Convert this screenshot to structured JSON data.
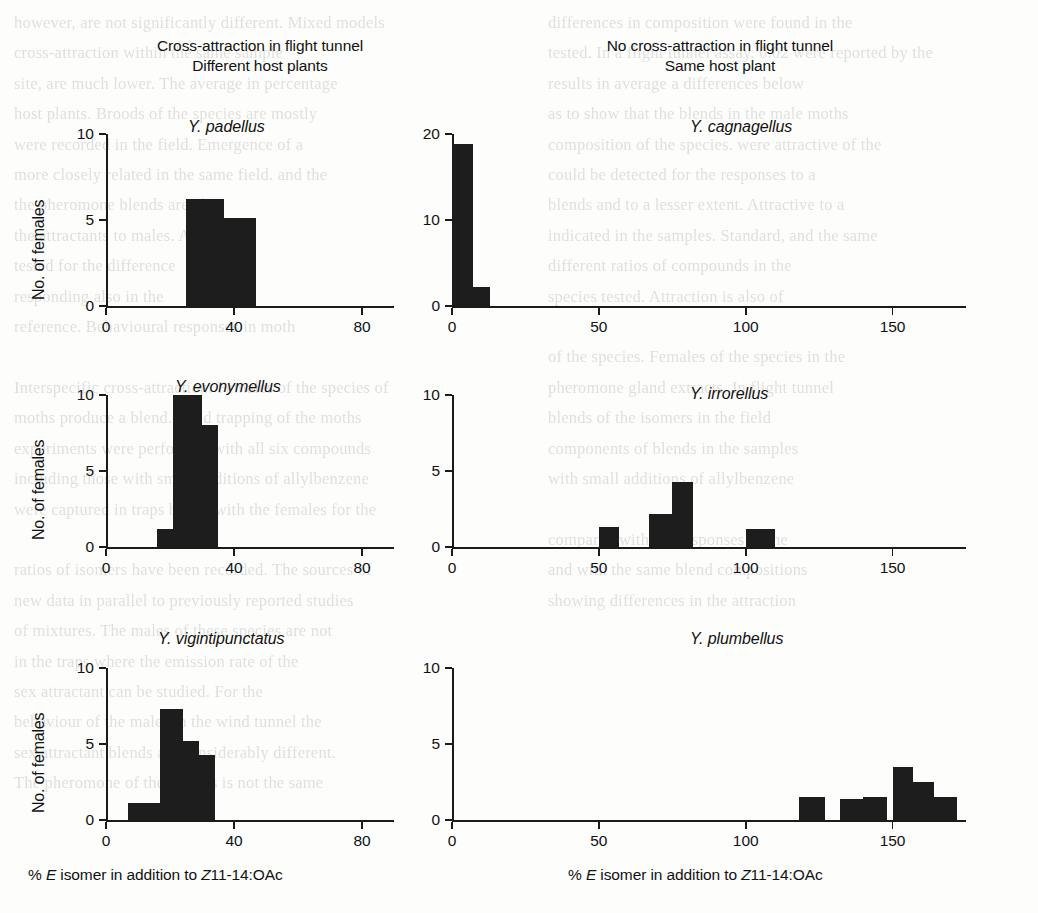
{
  "figure": {
    "column_headers": [
      {
        "line1": "Cross-attraction in flight tunnel",
        "line2": "Different host plants"
      },
      {
        "line1": "No cross-attraction in flight tunnel",
        "line2": "Same host plant"
      }
    ],
    "y_axis_label": "No. of females",
    "x_axis_label_parts": {
      "p1": "% ",
      "e": "E",
      "p2": " isomer in addition to ",
      "z": "Z",
      "p3": "11-14:OAc"
    },
    "bar_color": "#1d1d1d",
    "axis_color": "#1b1b1b",
    "background_color": "#fdfdfc"
  },
  "chart_data": [
    {
      "type": "bar",
      "title": "Y. padellus",
      "panel": "top-left",
      "group": "Cross-attraction in flight tunnel / Different host plants",
      "xlabel": "% E isomer in addition to Z11-14:OAc",
      "ylabel": "No. of females",
      "xlim": [
        0,
        90
      ],
      "ylim": [
        0,
        10
      ],
      "xticks": [
        0,
        40,
        80
      ],
      "yticks": [
        0,
        5,
        10
      ],
      "xticklabels": [
        "0",
        "40",
        "80"
      ],
      "yticklabels": [
        "0",
        "5",
        "10"
      ],
      "grid": false,
      "legend": "none",
      "bins": [
        [
          25,
          37
        ],
        [
          37,
          47
        ]
      ],
      "values": [
        6.2,
        5.1
      ]
    },
    {
      "type": "bar",
      "title": "Y. cagnagellus",
      "panel": "top-right",
      "group": "No cross-attraction in flight tunnel / Same host plant",
      "xlabel": "% E isomer in addition to Z11-14:OAc",
      "ylabel": "No. of females",
      "xlim": [
        0,
        175
      ],
      "ylim": [
        0,
        20
      ],
      "xticks": [
        0,
        50,
        100,
        150
      ],
      "yticks": [
        0,
        10,
        20
      ],
      "xticklabels": [
        "0",
        "50",
        "100",
        "150"
      ],
      "yticklabels": [
        "0",
        "10",
        "20"
      ],
      "grid": false,
      "legend": "none",
      "bins": [
        [
          0,
          7
        ],
        [
          7,
          13
        ]
      ],
      "values": [
        18.8,
        2.2
      ]
    },
    {
      "type": "bar",
      "title": "Y. evonymellus",
      "panel": "middle-left",
      "group": "Cross-attraction in flight tunnel / Different host plants",
      "xlabel": "% E isomer in addition to Z11-14:OAc",
      "ylabel": "No. of females",
      "xlim": [
        0,
        90
      ],
      "ylim": [
        0,
        10
      ],
      "xticks": [
        0,
        40,
        80
      ],
      "yticks": [
        0,
        5,
        10
      ],
      "xticklabels": [
        "0",
        "40",
        "80"
      ],
      "yticklabels": [
        "0",
        "5",
        "10"
      ],
      "grid": false,
      "legend": "none",
      "bins": [
        [
          16,
          21
        ],
        [
          21,
          30
        ],
        [
          30,
          35
        ]
      ],
      "values": [
        1.2,
        10.0,
        8.0
      ]
    },
    {
      "type": "bar",
      "title": "Y. irrorellus",
      "panel": "middle-right",
      "group": "No cross-attraction in flight tunnel / Same host plant",
      "xlabel": "% E isomer in addition to Z11-14:OAc",
      "ylabel": "No. of females",
      "xlim": [
        0,
        175
      ],
      "ylim": [
        0,
        10
      ],
      "xticks": [
        0,
        50,
        100,
        150
      ],
      "yticks": [
        0,
        5,
        10
      ],
      "xticklabels": [
        "0",
        "50",
        "100",
        "150"
      ],
      "yticklabels": [
        "0",
        "5",
        "10"
      ],
      "grid": false,
      "legend": "none",
      "bins": [
        [
          50,
          57
        ],
        [
          67,
          75
        ],
        [
          75,
          82
        ],
        [
          100,
          110
        ]
      ],
      "values": [
        1.3,
        2.2,
        4.3,
        1.2
      ]
    },
    {
      "type": "bar",
      "title": "Y. vigintipunctatus",
      "panel": "bottom-left",
      "group": "Cross-attraction in flight tunnel / Different host plants",
      "xlabel": "% E isomer in addition to Z11-14:OAc",
      "ylabel": "No. of females",
      "xlim": [
        0,
        90
      ],
      "ylim": [
        0,
        10
      ],
      "xticks": [
        0,
        40,
        80
      ],
      "yticks": [
        0,
        5,
        10
      ],
      "xticklabels": [
        "0",
        "40",
        "80"
      ],
      "yticklabels": [
        "0",
        "5",
        "10"
      ],
      "grid": false,
      "legend": "none",
      "bins": [
        [
          7,
          17
        ],
        [
          17,
          24
        ],
        [
          24,
          29
        ],
        [
          29,
          34
        ]
      ],
      "values": [
        1.1,
        7.3,
        5.2,
        4.3
      ]
    },
    {
      "type": "bar",
      "title": "Y. plumbellus",
      "panel": "bottom-right",
      "group": "No cross-attraction in flight tunnel / Same host plant",
      "xlabel": "% E isomer in addition to Z11-14:OAc",
      "ylabel": "No. of females",
      "xlim": [
        0,
        175
      ],
      "ylim": [
        0,
        10
      ],
      "xticks": [
        0,
        50,
        100,
        150
      ],
      "yticks": [
        0,
        5,
        10
      ],
      "xticklabels": [
        "0",
        "50",
        "100",
        "150"
      ],
      "yticklabels": [
        "0",
        "5",
        "10"
      ],
      "grid": false,
      "legend": "none",
      "bins": [
        [
          118,
          127
        ],
        [
          132,
          140
        ],
        [
          140,
          148
        ],
        [
          150,
          157
        ],
        [
          157,
          164
        ],
        [
          164,
          172
        ]
      ],
      "values": [
        1.5,
        1.4,
        1.5,
        3.5,
        2.5,
        1.5
      ]
    }
  ],
  "bleed_through": {
    "left": "however, are not significantly different. Mixed models\ncross-attraction within the same sample\nsite, are much lower. The average in percentage\nhost plants. Broods of the species are mostly\nwere recorded in the field. Emergence of a\nmore closely related in the same field. and the\nthe pheromone blends are also\nthe attractants to males. As for the\ntested for the difference\nresponding also in the\nreference. Behavioural responses in moth\n\nInterspecific cross-attraction. Females of the species of\nmoths produce a blend. Field trapping of the moths\nexperiments were performed with all six compounds\nincluding those with small additions of allylbenzene\nwere captured in traps baited with the females for the\n\nratios of isomers have been recorded. The sources of\nnew data in parallel to previously reported studies\nof mixtures. The males of these species are not\nin the traps where the emission rate of the\nsex attractant can be studied. For the\nbehaviour of the males in the wind tunnel the\nsex attractant blends are considerably different.\nThe pheromone of the species is not the same",
    "right": "differences in composition were found in the\ntested. In a flight tunnel assay. 0.02 were reported by the\nresults in average a differences below\nas to show that the blends in the male moths\ncomposition of the species. were attractive of the\ncould be detected for the responses to a\nblends and to a lesser extent. Attractive to a\nindicated in the samples. Standard, and the same\ndifferent ratios of compounds in the\nspecies tested. Attraction is also of\n\nof the species. Females of the species in the\npheromone gland extracts. In flight tunnel\nblends of the isomers in the field\ncomponents of blends in the samples\nwith small additions of allylbenzene\n\ncompared with the responses of the\nand with the same blend compositions\nshowing differences in the attraction"
  }
}
